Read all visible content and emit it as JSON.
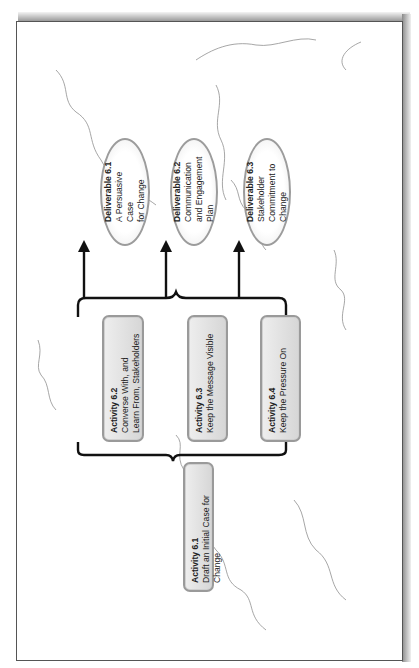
{
  "diagram": {
    "orientation": "rotated-90-ccw",
    "background": "faint world map outline",
    "colors": {
      "box_fill": "#dcdcdc",
      "box_border": "#9a9a9a",
      "ellipse_border": "#9c9c9c",
      "connector": "#111111",
      "map_outline": "#8a8a8a"
    },
    "activities": [
      {
        "id": "6.1",
        "title": "Activity 6.1",
        "text": "Draft an Initial Case for Change"
      },
      {
        "id": "6.2",
        "title": "Activity 6.2",
        "text_lines": [
          "Converse With, and",
          "Learn From, Stakeholders"
        ]
      },
      {
        "id": "6.3",
        "title": "Activity 6.3",
        "text": "Keep the Message Visible"
      },
      {
        "id": "6.4",
        "title": "Activity 6.4",
        "text": "Keep the Pressure On"
      }
    ],
    "deliverables": [
      {
        "id": "6.1",
        "title": "Deliverable 6.1",
        "text_lines": [
          "A Persuasive Case",
          "for Change"
        ]
      },
      {
        "id": "6.2",
        "title": "Deliverable 6.2",
        "text_lines": [
          "Communication",
          "and Engagement",
          "Plan"
        ]
      },
      {
        "id": "6.3",
        "title": "Deliverable 6.3",
        "text_lines": [
          "Stakeholder",
          "Commitment to",
          "Change"
        ]
      }
    ],
    "connections": [
      {
        "from": "Activity 6.1",
        "to": [
          "Activity 6.2",
          "Activity 6.3",
          "Activity 6.4"
        ],
        "style": "brace"
      },
      {
        "from": [
          "Activity 6.2",
          "Activity 6.3",
          "Activity 6.4"
        ],
        "to": [
          "Deliverable 6.1",
          "Deliverable 6.2",
          "Deliverable 6.3"
        ],
        "style": "brace-with-arrows"
      }
    ]
  }
}
